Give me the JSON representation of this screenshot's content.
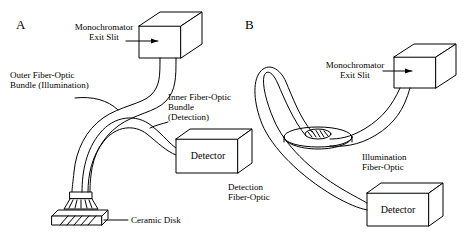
{
  "figure": {
    "title": "",
    "panels": [
      {
        "letter": "A",
        "labels": {
          "monochromator": "Monochromator\nExit Slit",
          "outer_bundle": "Outer Fiber-Optic\nBundle (Illumination)",
          "inner_bundle": "Inner Fiber-Optic\nBundle\n(Detection)",
          "detector": "Detector",
          "ceramic_disk": "Ceramic Disk"
        }
      },
      {
        "letter": "B",
        "labels": {
          "monochromator": "Monochromator\nExit Slit",
          "illumination": "Illumination\nFiber-Optic",
          "detection": "Detection\nFiber-Optic",
          "detector": "Detector"
        }
      }
    ],
    "colors": {
      "line": "#000000",
      "background": "#ffffff",
      "fill": "#ffffff"
    }
  }
}
